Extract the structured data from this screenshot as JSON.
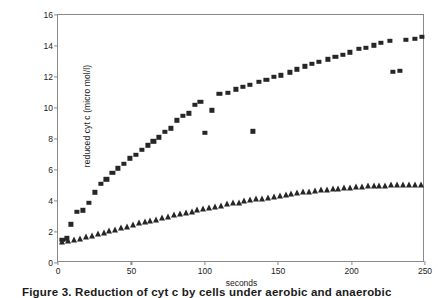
{
  "figure": {
    "caption": "Figure 3.  Reduction of cyt c by cells under aerobic and anaerobic"
  },
  "chart_data": {
    "type": "scatter",
    "title": "",
    "xlabel": "seconds",
    "ylabel": "reduced cyt c (micro mol/l)",
    "xlim": [
      0,
      250
    ],
    "ylim": [
      0,
      16
    ],
    "xticks": [
      0,
      50,
      100,
      150,
      200,
      250
    ],
    "yticks": [
      0,
      2,
      4,
      6,
      8,
      10,
      12,
      14,
      16
    ],
    "grid": false,
    "legend": "none",
    "series": [
      {
        "name": "squares",
        "marker": "square",
        "color": "#262626",
        "points": [
          [
            3,
            1.5
          ],
          [
            6,
            1.6
          ],
          [
            9,
            2.5
          ],
          [
            13,
            3.3
          ],
          [
            17,
            3.4
          ],
          [
            21,
            3.9
          ],
          [
            25,
            4.55
          ],
          [
            29,
            5.1
          ],
          [
            33,
            5.4
          ],
          [
            37,
            5.8
          ],
          [
            41,
            6.1
          ],
          [
            45,
            6.4
          ],
          [
            49,
            6.75
          ],
          [
            53,
            7.0
          ],
          [
            57,
            7.3
          ],
          [
            61,
            7.6
          ],
          [
            65,
            7.85
          ],
          [
            69,
            8.1
          ],
          [
            73,
            8.45
          ],
          [
            77,
            8.7
          ],
          [
            81,
            9.2
          ],
          [
            85,
            9.5
          ],
          [
            89,
            9.65
          ],
          [
            93,
            10.2
          ],
          [
            97,
            10.4
          ],
          [
            100,
            8.4
          ],
          [
            105,
            9.85
          ],
          [
            110,
            10.9
          ],
          [
            116,
            11.0
          ],
          [
            121,
            11.2
          ],
          [
            126,
            11.35
          ],
          [
            131,
            11.5
          ],
          [
            133,
            8.5
          ],
          [
            137,
            11.7
          ],
          [
            142,
            11.8
          ],
          [
            147,
            12.0
          ],
          [
            152,
            12.1
          ],
          [
            158,
            12.3
          ],
          [
            163,
            12.5
          ],
          [
            168,
            12.7
          ],
          [
            173,
            12.85
          ],
          [
            178,
            13.0
          ],
          [
            184,
            13.15
          ],
          [
            189,
            13.3
          ],
          [
            194,
            13.45
          ],
          [
            199,
            13.6
          ],
          [
            205,
            13.8
          ],
          [
            210,
            13.9
          ],
          [
            215,
            14.05
          ],
          [
            220,
            14.2
          ],
          [
            226,
            14.35
          ],
          [
            228,
            12.35
          ],
          [
            233,
            12.4
          ],
          [
            237,
            14.4
          ],
          [
            243,
            14.45
          ],
          [
            248,
            14.6
          ]
        ]
      },
      {
        "name": "triangles",
        "marker": "triangle",
        "color": "#262626",
        "points": [
          [
            3,
            1.35
          ],
          [
            7,
            1.4
          ],
          [
            11,
            1.5
          ],
          [
            15,
            1.55
          ],
          [
            19,
            1.65
          ],
          [
            23,
            1.75
          ],
          [
            27,
            1.85
          ],
          [
            31,
            1.95
          ],
          [
            35,
            2.05
          ],
          [
            39,
            2.15
          ],
          [
            43,
            2.25
          ],
          [
            47,
            2.35
          ],
          [
            51,
            2.45
          ],
          [
            55,
            2.55
          ],
          [
            59,
            2.65
          ],
          [
            63,
            2.72
          ],
          [
            67,
            2.8
          ],
          [
            71,
            2.9
          ],
          [
            75,
            3.0
          ],
          [
            79,
            3.08
          ],
          [
            83,
            3.15
          ],
          [
            87,
            3.25
          ],
          [
            91,
            3.32
          ],
          [
            95,
            3.4
          ],
          [
            99,
            3.48
          ],
          [
            103,
            3.55
          ],
          [
            107,
            3.62
          ],
          [
            111,
            3.7
          ],
          [
            115,
            3.78
          ],
          [
            119,
            3.85
          ],
          [
            123,
            3.9
          ],
          [
            127,
            3.98
          ],
          [
            131,
            4.05
          ],
          [
            135,
            4.1
          ],
          [
            139,
            4.15
          ],
          [
            143,
            4.22
          ],
          [
            147,
            4.28
          ],
          [
            151,
            4.34
          ],
          [
            155,
            4.4
          ],
          [
            159,
            4.45
          ],
          [
            163,
            4.5
          ],
          [
            167,
            4.55
          ],
          [
            171,
            4.6
          ],
          [
            175,
            4.64
          ],
          [
            179,
            4.68
          ],
          [
            183,
            4.72
          ],
          [
            187,
            4.76
          ],
          [
            191,
            4.8
          ],
          [
            195,
            4.83
          ],
          [
            199,
            4.86
          ],
          [
            203,
            4.89
          ],
          [
            207,
            4.92
          ],
          [
            211,
            4.94
          ],
          [
            215,
            4.96
          ],
          [
            219,
            4.98
          ],
          [
            223,
            5.0
          ],
          [
            227,
            5.01
          ],
          [
            231,
            5.02
          ],
          [
            235,
            5.03
          ],
          [
            239,
            5.04
          ],
          [
            243,
            5.05
          ],
          [
            247,
            5.06
          ]
        ]
      }
    ]
  }
}
